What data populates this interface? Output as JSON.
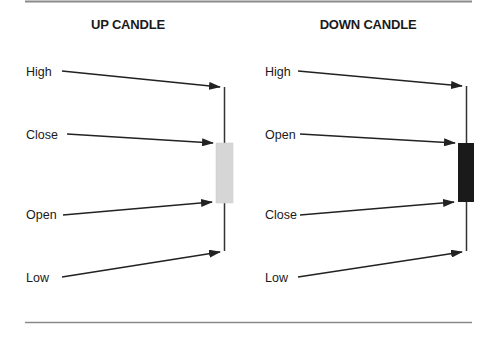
{
  "diagram": {
    "panels": [
      {
        "title": "UP CANDLE",
        "labels": [
          "High",
          "Close",
          "Open",
          "Low"
        ],
        "body_color": "#d6d6d6"
      },
      {
        "title": "DOWN CANDLE",
        "labels": [
          "High",
          "Open",
          "Close",
          "Low"
        ],
        "body_color": "#1a1a1a"
      }
    ],
    "colors": {
      "line": "#333333",
      "rule": "#8a8a8a",
      "text": "#1a1a1a"
    }
  }
}
